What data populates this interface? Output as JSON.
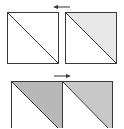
{
  "diagram": {
    "colors": {
      "stroke": "#3a3a3a",
      "background": "#ffffff",
      "light_fill": "#ebebeb",
      "mid_fill": "#c4c4c4",
      "dark_fill": "#b4b4b4",
      "arrow": "#333333"
    },
    "top_row": {
      "arrow_direction": "left",
      "squares": [
        {
          "id": "top-left",
          "upper_triangle_fill": "#ffffff",
          "lower_triangle_fill": "#ffffff"
        },
        {
          "id": "top-right",
          "upper_triangle_fill": "#e8e8e8",
          "lower_triangle_fill": "#ffffff"
        }
      ]
    },
    "bottom_row": {
      "arrow_direction": "right",
      "squares": [
        {
          "id": "bottom-left",
          "upper_triangle_fill": "#b8b8b8",
          "lower_triangle_fill": "#ffffff"
        },
        {
          "id": "bottom-right",
          "upper_triangle_fill": "#c8c8c8",
          "lower_triangle_fill": "#ffffff"
        }
      ]
    }
  }
}
